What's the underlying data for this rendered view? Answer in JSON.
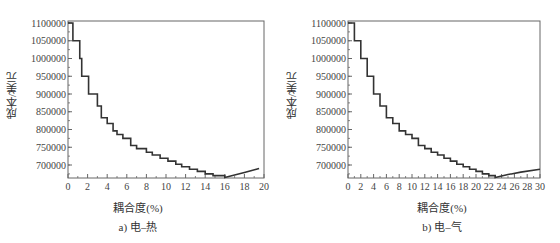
{
  "chart_data": [
    {
      "type": "line",
      "style": "step",
      "title": "",
      "caption": "a) 电–热",
      "xlabel": "耦合度(%)",
      "ylabel": "成本/美元",
      "xlim": [
        0,
        20
      ],
      "ylim": [
        660000,
        1105000
      ],
      "xticks": [
        0,
        2,
        4,
        6,
        8,
        10,
        12,
        14,
        16,
        18,
        20
      ],
      "yticks": [
        700000,
        750000,
        800000,
        850000,
        900000,
        950000,
        1000000,
        1050000,
        1100000
      ],
      "grid": false,
      "x": [
        0,
        0.5,
        1.2,
        1.4,
        2.1,
        3.0,
        3.4,
        4.0,
        4.6,
        5.0,
        5.6,
        6.4,
        7.0,
        8.0,
        8.6,
        9.4,
        10.2,
        11.0,
        11.6,
        12.4,
        13.2,
        14.0,
        14.8,
        16.0,
        17.0,
        18.0,
        19.5
      ],
      "y": [
        1100000,
        1050000,
        1000000,
        950000,
        900000,
        866000,
        833000,
        817000,
        796000,
        786000,
        775000,
        755000,
        746000,
        736000,
        728000,
        719000,
        711000,
        702000,
        695000,
        688000,
        682000,
        675000,
        670000,
        665000,
        672000,
        679000,
        690000
      ]
    },
    {
      "type": "line",
      "style": "step",
      "title": "",
      "caption": "b) 电–气",
      "xlabel": "耦合度(%)",
      "ylabel": "成本/美元",
      "xlim": [
        0,
        30
      ],
      "ylim": [
        660000,
        1105000
      ],
      "xticks": [
        0,
        2,
        4,
        6,
        8,
        10,
        12,
        14,
        16,
        18,
        20,
        22,
        24,
        26,
        28,
        30
      ],
      "yticks": [
        700000,
        750000,
        800000,
        850000,
        900000,
        950000,
        1000000,
        1050000,
        1100000
      ],
      "grid": false,
      "x": [
        0,
        1,
        2,
        3,
        4,
        5,
        6,
        7,
        8,
        9,
        10,
        11,
        12,
        13,
        14,
        15,
        16,
        17,
        18,
        19,
        20,
        21,
        22,
        23,
        25,
        27,
        30
      ],
      "y": [
        1100000,
        1050000,
        1000000,
        950000,
        900000,
        866000,
        833000,
        817000,
        796000,
        786000,
        775000,
        755000,
        746000,
        736000,
        728000,
        719000,
        711000,
        702000,
        695000,
        688000,
        682000,
        675000,
        670000,
        665000,
        673000,
        680000,
        688000
      ]
    }
  ],
  "panels": [
    {
      "ylabel": "成本/美元",
      "xlabel": "耦合度(%)",
      "caption": "a) 电–热"
    },
    {
      "ylabel": "成本/美元",
      "xlabel": "耦合度(%)",
      "caption": "b) 电–气"
    }
  ]
}
